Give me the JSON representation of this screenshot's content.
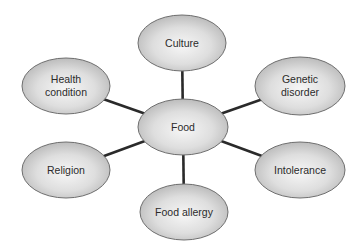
{
  "diagram": {
    "type": "hub-and-spoke",
    "colors": {
      "background": "#ffffff",
      "ellipse_fill_center": "#f4f4f4",
      "ellipse_fill_edge": "#b8b8b8",
      "ellipse_stroke": "#6e6e6e",
      "connector": "#2a2a2a",
      "text": "#2b2b2b"
    },
    "center": {
      "id": "food",
      "label": "Food",
      "cx": 183,
      "cy": 127,
      "rx": 45,
      "ry": 28
    },
    "nodes": [
      {
        "id": "culture",
        "label": "Culture",
        "cx": 182,
        "cy": 43,
        "rx": 44,
        "ry": 28
      },
      {
        "id": "health-condition",
        "label": "Health\ncondition",
        "cx": 66,
        "cy": 86,
        "rx": 44,
        "ry": 28
      },
      {
        "id": "genetic-disorder",
        "label": "Genetic\ndisorder",
        "cx": 300,
        "cy": 86,
        "rx": 45,
        "ry": 29
      },
      {
        "id": "religion",
        "label": "Religion",
        "cx": 66,
        "cy": 170,
        "rx": 44,
        "ry": 28
      },
      {
        "id": "intolerance",
        "label": "Intolerance",
        "cx": 300,
        "cy": 170,
        "rx": 45,
        "ry": 28
      },
      {
        "id": "food-allergy",
        "label": "Food allergy",
        "cx": 184,
        "cy": 212,
        "rx": 44,
        "ry": 28
      }
    ],
    "edges": [
      {
        "from": "food",
        "to": "culture"
      },
      {
        "from": "food",
        "to": "health-condition"
      },
      {
        "from": "food",
        "to": "genetic-disorder"
      },
      {
        "from": "food",
        "to": "religion"
      },
      {
        "from": "food",
        "to": "intolerance"
      },
      {
        "from": "food",
        "to": "food-allergy"
      }
    ]
  }
}
